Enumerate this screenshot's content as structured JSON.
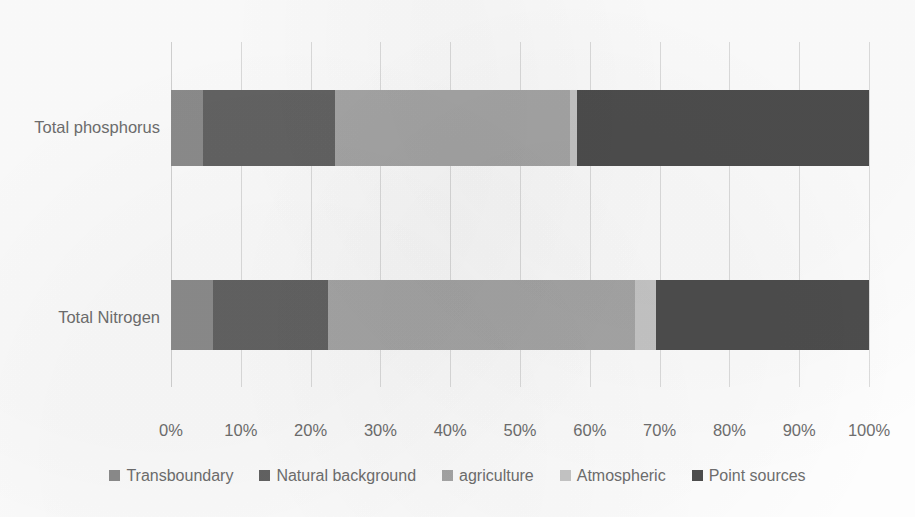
{
  "chart_data": {
    "type": "bar",
    "orientation": "horizontal",
    "stacked": true,
    "normalized_percent": true,
    "title": "",
    "subtitle": "",
    "xlabel": "",
    "ylabel": "",
    "xlim": [
      0,
      100
    ],
    "grid": true,
    "grid_axis": "x",
    "legend_position": "bottom",
    "categories": [
      "Total phosphorus",
      "Total Nitrogen"
    ],
    "tick_labels": [
      "0%",
      "10%",
      "20%",
      "30%",
      "40%",
      "50%",
      "60%",
      "70%",
      "80%",
      "90%",
      "100%"
    ],
    "tick_values": [
      0,
      10,
      20,
      30,
      40,
      50,
      60,
      70,
      80,
      90,
      100
    ],
    "series": [
      {
        "name": "Transboundary",
        "color": "#8c8c8c",
        "values": [
          4.6,
          6.0
        ]
      },
      {
        "name": "Natural background",
        "color": "#636363",
        "values": [
          18.9,
          16.5
        ]
      },
      {
        "name": "agriculture",
        "color": "#a6a6a6",
        "values": [
          33.7,
          44.0
        ]
      },
      {
        "name": "Atmospheric",
        "color": "#c6c6c6",
        "values": [
          1.0,
          3.0
        ]
      },
      {
        "name": "Point sources",
        "color": "#4d4d4d",
        "values": [
          41.8,
          30.5
        ]
      }
    ]
  },
  "legend": {
    "items": [
      {
        "label": "Transboundary",
        "color": "#8c8c8c"
      },
      {
        "label": "Natural background",
        "color": "#636363"
      },
      {
        "label": "agriculture",
        "color": "#a6a6a6"
      },
      {
        "label": "Atmospheric",
        "color": "#c6c6c6"
      },
      {
        "label": "Point sources",
        "color": "#4d4d4d"
      }
    ]
  },
  "axis": {
    "x_ticks": [
      "0%",
      "10%",
      "20%",
      "30%",
      "40%",
      "50%",
      "60%",
      "70%",
      "80%",
      "90%",
      "100%"
    ],
    "y_categories": [
      "Total phosphorus",
      "Total Nitrogen"
    ]
  },
  "colors": {
    "gridline": "#dcdcdc",
    "text": "#6e6e6e",
    "background": "#fdfdfd"
  }
}
